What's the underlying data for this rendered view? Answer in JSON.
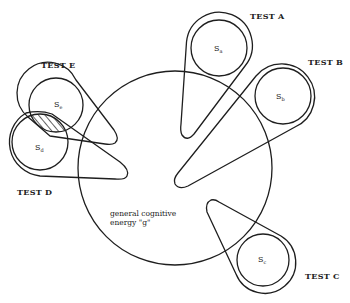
{
  "diagram": {
    "type": "overlapping-factors-diagram",
    "central": {
      "label_line1": "general cognitive",
      "label_line2": "energy \"g\""
    },
    "tests": [
      {
        "id": "A",
        "label": "TEST A",
        "factor": "S",
        "factor_sub": "a"
      },
      {
        "id": "B",
        "label": "TEST B",
        "factor": "S",
        "factor_sub": "b"
      },
      {
        "id": "C",
        "label": "TEST C",
        "factor": "S",
        "factor_sub": "c"
      },
      {
        "id": "D",
        "label": "TEST D",
        "factor": "S",
        "factor_sub": "d"
      },
      {
        "id": "E",
        "label": "TEST E",
        "factor": "S",
        "factor_sub": "e"
      }
    ],
    "overlap": {
      "between": [
        "S_e",
        "S_d"
      ],
      "style": "hatched"
    },
    "colors": {
      "line": "#1e1e1e",
      "background": "#ffffff"
    }
  }
}
